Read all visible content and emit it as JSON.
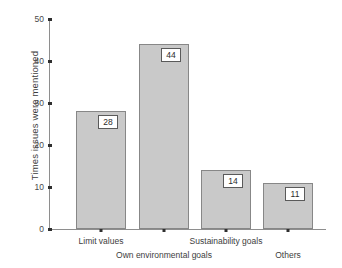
{
  "chart_data": {
    "type": "bar",
    "title": "",
    "subtitle": "",
    "xlabel": "",
    "ylabel": "Times issues were mentioned",
    "categories": [
      "Limit values",
      "Own environmental goals",
      "Sustainability goals",
      "Others"
    ],
    "values": [
      28,
      44,
      14,
      11
    ],
    "data_labels": [
      "28",
      "44",
      "14",
      "11"
    ],
    "ylim": [
      0,
      50
    ],
    "y_ticks": [
      0,
      10,
      20,
      30,
      40,
      50
    ],
    "y_tick_labels": [
      "0",
      "10",
      "20",
      "30",
      "40",
      "50"
    ],
    "grid": false,
    "legend": false,
    "legend_position": "none",
    "category_label_rows": [
      1,
      2,
      1,
      2
    ],
    "colors": {
      "bar_fill": "#c9c9c9",
      "bar_border": "#878787",
      "axis": "#8e8e8e",
      "tick_mark": "#2f2f2f",
      "text": "#3d3d3d",
      "label_box_background": "#ffffff",
      "label_box_border": "#5a5a5a",
      "background": "#ffffff"
    }
  }
}
